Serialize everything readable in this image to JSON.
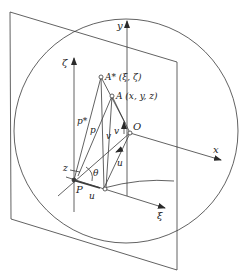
{
  "figure": {
    "type": "geometric-projection-diagram",
    "colors": {
      "stroke": "#3a3a3a",
      "background": "#ffffff"
    },
    "labels": {
      "y_axis": "y",
      "x_axis": "x",
      "zeta_axis": "ζ",
      "xi_axis": "ξ",
      "origin": "O",
      "point_a_star": "A* (ξ, ζ)",
      "point_a": "A (x, y, z)",
      "p_star": "p*",
      "p": "p",
      "v_left": "v",
      "v_right": "v",
      "z": "z",
      "theta": "θ",
      "u_bottom": "u",
      "u_right": "u",
      "point_p": "P"
    }
  }
}
